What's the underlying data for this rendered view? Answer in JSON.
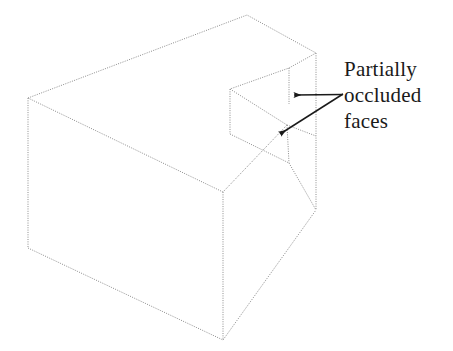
{
  "figure": {
    "background_color": "#ffffff",
    "line_color": "#8c8c8c",
    "arrow_color": "#1a1a1a",
    "text_color": "#1a1a1a",
    "line_style": "dotted",
    "width": 453,
    "height": 351
  },
  "annotation": {
    "line1": "Partially",
    "line2": "occluded",
    "line3": "faces",
    "full_text": "Partially occluded faces",
    "arrow_count": 2
  },
  "shape": {
    "name": "notched-rectangular-block",
    "description": "Isometric wireframe of a rectangular block with a rectangular notch cut into its right end",
    "vertices": {
      "top_apex": [
        247,
        15
      ],
      "top_left": [
        28,
        98
      ],
      "top_right_back": [
        316,
        53
      ],
      "front_top": [
        223,
        192
      ],
      "bottom_left": [
        28,
        248
      ],
      "bottom_front": [
        223,
        340
      ],
      "right_lower": [
        316,
        210
      ],
      "notch_outer_upper": [
        289,
        68
      ],
      "notch_inner_upper": [
        230,
        89
      ],
      "notch_mid": [
        287,
        125
      ],
      "notch_inner_lower": [
        230,
        134
      ],
      "notch_outer_lower": [
        289,
        163
      ]
    }
  },
  "arrows": [
    {
      "name": "arrow-to-upper-face",
      "from": [
        343,
        94
      ],
      "to": [
        292,
        95
      ],
      "direction": "left"
    },
    {
      "name": "arrow-to-lower-face",
      "from": [
        343,
        94
      ],
      "to": [
        278,
        136
      ],
      "direction": "down-left"
    }
  ]
}
